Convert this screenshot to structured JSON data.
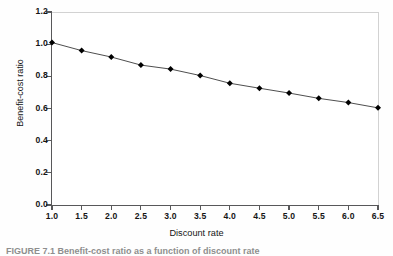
{
  "figure": {
    "caption": "FIGURE 7.1  Benefit-cost ratio as a function of discount rate"
  },
  "chart_data": {
    "type": "line",
    "title": "",
    "xlabel": "Discount rate",
    "ylabel": "Benefit-cost ratio",
    "xlim": [
      1.0,
      6.5
    ],
    "ylim": [
      0.0,
      1.2
    ],
    "grid": false,
    "legend": null,
    "marker": "diamond",
    "marker_color": "#000000",
    "line_color": "#3a3a3a",
    "x": [
      1.0,
      1.5,
      2.0,
      2.5,
      3.0,
      3.5,
      4.0,
      4.5,
      5.0,
      5.5,
      6.0,
      6.5
    ],
    "values": [
      1.01,
      0.96,
      0.92,
      0.87,
      0.845,
      0.805,
      0.757,
      0.726,
      0.696,
      0.663,
      0.637,
      0.604
    ],
    "xticklabels": [
      "1.0",
      "1.5",
      "2.0",
      "2.5",
      "3.0",
      "3.5",
      "4.0",
      "4.5",
      "5.0",
      "5.5",
      "6.0",
      "6.5"
    ],
    "yticklabels": [
      "0.0",
      "0.2",
      "0.4",
      "0.6",
      "0.8",
      "1.0",
      "1.2"
    ],
    "yticks": [
      0.0,
      0.2,
      0.4,
      0.6,
      0.8,
      1.0,
      1.2
    ]
  }
}
